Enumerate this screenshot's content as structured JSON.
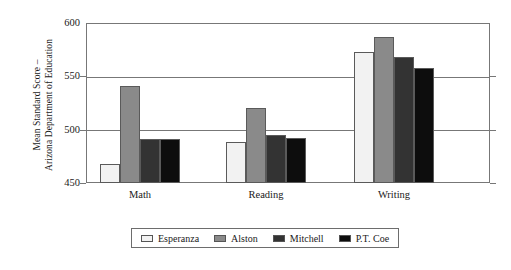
{
  "chart_data": {
    "type": "bar",
    "title": "",
    "subtitle": "",
    "xlabel": "",
    "ylabel": "Mean Standard Score – Arizona Department of Education",
    "ylabel_lines": [
      "Mean Standard Score –",
      "Arizona Department of Education"
    ],
    "categories": [
      "Math",
      "Reading",
      "Writing"
    ],
    "series": [
      {
        "name": "Esperanza",
        "values": [
          468,
          488,
          573
        ],
        "color": "#f2f2f2"
      },
      {
        "name": "Alston",
        "values": [
          541,
          520,
          587
        ],
        "color": "#8a8a8a"
      },
      {
        "name": "Mitchell",
        "values": [
          491,
          495,
          568
        ],
        "color": "#333333"
      },
      {
        "name": "P.T. Coe",
        "values": [
          491,
          492,
          558
        ],
        "color": "#0d0d0d"
      }
    ],
    "ylim": [
      450,
      600
    ],
    "yticks": [
      450,
      500,
      550,
      600
    ],
    "ytick_labels": [
      "450",
      "500",
      "550",
      "600"
    ],
    "grid": true,
    "legend_position": "bottom"
  },
  "legend": {
    "items": [
      {
        "label": "Esperanza",
        "color": "#f2f2f2"
      },
      {
        "label": "Alston",
        "color": "#8a8a8a"
      },
      {
        "label": "Mitchell",
        "color": "#333333"
      },
      {
        "label": "P.T. Coe",
        "color": "#0d0d0d"
      }
    ]
  },
  "axis": {
    "line_color": "#777777",
    "bar_edge_color": "#5a5a5a"
  }
}
